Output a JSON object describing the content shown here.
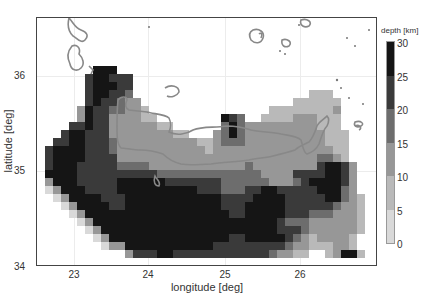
{
  "chart_data": {
    "type": "heatmap",
    "title": "",
    "xlabel": "longitude [deg]",
    "ylabel": "latitude [deg]",
    "xlim": [
      22.5,
      27.0
    ],
    "ylim": [
      34.0,
      36.6
    ],
    "x_ticks": [
      23,
      24,
      25,
      26
    ],
    "y_ticks": [
      34,
      35,
      36
    ],
    "grid": true,
    "colorbar": {
      "label": "depth [km]",
      "range": [
        0,
        30
      ],
      "ticks": [
        0,
        5,
        10,
        15,
        20,
        25,
        30
      ],
      "levels": [
        {
          "min": 0,
          "max": 5,
          "color": "#d9d9d9"
        },
        {
          "min": 5,
          "max": 10,
          "color": "#b9b9b9"
        },
        {
          "min": 10,
          "max": 15,
          "color": "#979797"
        },
        {
          "min": 15,
          "max": 20,
          "color": "#6d6d6d"
        },
        {
          "min": 20,
          "max": 25,
          "color": "#3a3a3a"
        },
        {
          "min": 25,
          "max": 30,
          "color": "#151515"
        }
      ]
    },
    "grid_cells_note": "rows top->bottom, cols left->right; value = depth level index (0 = no data, 1..6 = colorbar level)",
    "cell_rows": [
      "0000000000000000000000000000000000000000000",
      "0000000000000000000000000000000000000000000",
      "0000000000000000000000000000000000000000000",
      "0000000000000000000000000000000000000000000",
      "0000000000000000000000000000000000000000000",
      "0000000000000000000000000000000000000000000",
      "0000000666000000000000000000000000000000000",
      "0000005665550000000000000000000000000000000",
      "0000005666550000000000000000000000000000000",
      "0000005665540000000000000000000000222000000",
      "0000005655433000000000000000000022222200000",
      "0000036554433200000000000000022222222300000",
      "0000036553333220000000065400222233322200000",
      "0000556553333332200000046433333333322200000",
      "0005665553333333322000346433333333332220000",
      "0055665554333333333322344433333333332220000",
      "0566665554333333333332333333333333333220000",
      "0566665555333333333333333333333333344320000",
      "0566655555444433333333333343333333356653000",
      "0666655555555554444444444444333355556653000",
      "0366655555666666555555544444433345666653000",
      "0136665555666666666655544455665555566643000",
      "0013666655566666666666655556666555556643200",
      "0001366665566666666666655566666555555433200",
      "0000136666666666666666665566666555444333200",
      "0000013666666666666666666666665444333333200",
      "0000001366666666666666666666665554333333200",
      "0000000136666666666666665566666543233332000",
      "0000000013366666666666555555555433222332000",
      "0000000000035556655555555555543322002366200",
      "0000000000000000000000000000000000000000000"
    ]
  },
  "axes": {
    "x_ticks": [
      {
        "label": "23",
        "x": 74
      },
      {
        "label": "24",
        "x": 148
      },
      {
        "label": "25",
        "x": 225
      },
      {
        "label": "26",
        "x": 300
      }
    ],
    "y_ticks": [
      {
        "label": "36",
        "y": 75
      },
      {
        "label": "35",
        "y": 170
      },
      {
        "label": "34",
        "y": 266
      }
    ]
  },
  "colorbar_ticks": [
    {
      "label": "30",
      "y": 43
    },
    {
      "label": "25",
      "y": 77
    },
    {
      "label": "20",
      "y": 110
    },
    {
      "label": "15",
      "y": 144
    },
    {
      "label": "10",
      "y": 177
    },
    {
      "label": "5",
      "y": 211
    },
    {
      "label": "0",
      "y": 244
    }
  ]
}
